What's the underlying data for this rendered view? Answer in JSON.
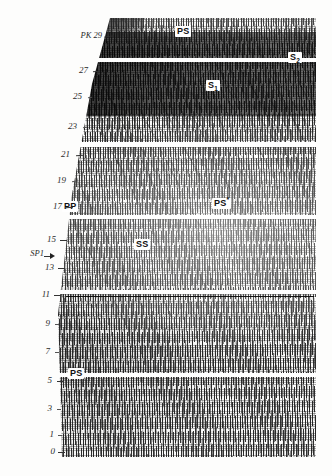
{
  "figure": {
    "type": "seismic-record-section"
  },
  "axis": {
    "name": "shot-point-axis",
    "orientation": "vertical-left",
    "top_label": "PK 29",
    "ticks": [
      {
        "label": "PK 29",
        "value": 29,
        "x": 78,
        "y": 37,
        "tick_x": 104,
        "tick_y": 36
      },
      {
        "label": "27",
        "value": 27,
        "x": 86,
        "y": 72,
        "tick_x": 99,
        "tick_y": 70
      },
      {
        "label": "25",
        "value": 25,
        "x": 80,
        "y": 97,
        "tick_x": 94,
        "tick_y": 96
      },
      {
        "label": "23",
        "value": 23,
        "x": 74,
        "y": 127,
        "tick_x": 90,
        "tick_y": 126
      },
      {
        "label": "21",
        "value": 21,
        "x": 68,
        "y": 155,
        "tick_x": 83,
        "tick_y": 154
      },
      {
        "label": "19",
        "value": 19,
        "x": 62,
        "y": 180,
        "tick_x": 79,
        "tick_y": 179
      },
      {
        "label": "17",
        "value": 17,
        "x": 58,
        "y": 207,
        "tick_x": 74,
        "tick_y": 206
      },
      {
        "label": "15",
        "value": 15,
        "x": 50,
        "y": 240,
        "tick_x": 69,
        "tick_y": 239
      },
      {
        "label": "13",
        "value": 13,
        "x": 46,
        "y": 268,
        "tick_x": 66,
        "tick_y": 267
      },
      {
        "label": "11",
        "value": 11,
        "x": 42,
        "y": 295,
        "tick_x": 63,
        "tick_y": 294
      },
      {
        "label": "9",
        "value": 9,
        "x": 44,
        "y": 324,
        "tick_x": 62,
        "tick_y": 323
      },
      {
        "label": "7",
        "value": 7,
        "x": 42,
        "y": 352,
        "tick_x": 61,
        "tick_y": 351
      },
      {
        "label": "5",
        "value": 5,
        "x": 44,
        "y": 381,
        "tick_x": 62,
        "tick_y": 380
      },
      {
        "label": "3",
        "value": 3,
        "x": 44,
        "y": 409,
        "tick_x": 62,
        "tick_y": 408
      },
      {
        "label": "1",
        "value": 1,
        "x": 45,
        "y": 435,
        "tick_x": 62,
        "tick_y": 434
      },
      {
        "label": "0",
        "value": 0,
        "x": 46,
        "y": 452,
        "tick_x": 62,
        "tick_y": 452
      }
    ],
    "shotpoint_marker": {
      "label": "SP1",
      "x": 16,
      "y": 254,
      "arrow_x": 46,
      "arrow_y": 256
    }
  },
  "phase_labels": [
    {
      "id": "ps-top",
      "text_html": "PS",
      "text": "PS",
      "x": 175,
      "y": 31,
      "note": "upper PS arrival annotation"
    },
    {
      "id": "s2",
      "text_html": "S",
      "text": "S2",
      "sub": "2",
      "x": 289,
      "y": 57,
      "note": "S2 phase, right edge"
    },
    {
      "id": "s1",
      "text_html": "S",
      "text": "S1",
      "sub": "1",
      "x": 207,
      "y": 84,
      "note": "S1 phase in dark band"
    },
    {
      "id": "pp",
      "text_html": "PP",
      "text": "PP",
      "x": 62,
      "y": 205,
      "note": "PP arrival near shotpoint"
    },
    {
      "id": "ps-star",
      "text_html": "PS",
      "text": "PS*",
      "sup": "*",
      "x": 212,
      "y": 201,
      "note": "PS* converted phase"
    },
    {
      "id": "ss",
      "text_html": "SS",
      "text": "SS",
      "x": 134,
      "y": 241,
      "note": "SS arrival"
    },
    {
      "id": "ps-bot",
      "text_html": "PS",
      "text": "PS",
      "x": 68,
      "y": 371,
      "note": "lower PS arrival annotation"
    }
  ],
  "bands": {
    "separators": [
      {
        "id": "sep-1",
        "top": 58,
        "height": 4
      },
      {
        "id": "sep-2",
        "top": 142,
        "height": 5
      },
      {
        "id": "sep-3",
        "top": 215,
        "height": 4
      },
      {
        "id": "sep-4",
        "top": 290,
        "height": 4
      },
      {
        "id": "sep-5",
        "top": 373,
        "height": 4
      }
    ],
    "dark_band": {
      "id": "dark-band-s1",
      "top": 62,
      "height": 82,
      "tone": "#000000"
    }
  },
  "horizons": [
    {
      "id": "horizon-11",
      "left": 66,
      "top": 296,
      "width": 250
    }
  ],
  "colors": {
    "paper": "#fdfdfc",
    "ink": "#111111",
    "label_box": "#ffffff",
    "axis_text": "#2a2a2a"
  }
}
